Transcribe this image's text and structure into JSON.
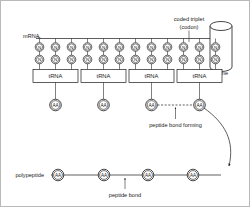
{
  "diagram": {
    "labels": {
      "mrna": "mRNA",
      "coded_triplet_line1": "coded triplet",
      "coded_triplet_line2": "(codon)",
      "ribosome": "ribosome",
      "peptide_bond_forming": "peptide bond forming",
      "polypeptide": "polypeptide",
      "peptide_bond": "peptide bond"
    },
    "nucleotide_label": "N",
    "amino_acid_label": "AA",
    "trna_label": "tRNA",
    "nucleotide_top_row": [
      "N",
      "N",
      "N",
      "N",
      "N",
      "N",
      "N",
      "N",
      "N",
      "N",
      "N",
      "N"
    ],
    "nucleotide_bottom_row": [
      "N",
      "N",
      "N",
      "N",
      "N",
      "N",
      "N",
      "N",
      "N",
      "N",
      "N",
      "N"
    ],
    "trna_boxes": [
      "tRNA",
      "tRNA",
      "tRNA",
      "tRNA"
    ],
    "trna_amino_acids": [
      "AA",
      "AA",
      "AA",
      "AA"
    ],
    "polypeptide_amino_acids": [
      "AA",
      "AA",
      "AA",
      "AA"
    ],
    "colors": {
      "ink": "#1a1a1a",
      "background": "#ffffff",
      "border": "#b9b9b9"
    }
  }
}
